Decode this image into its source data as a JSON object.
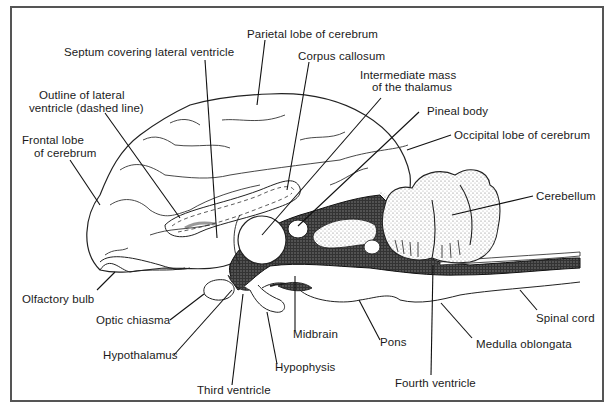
{
  "diagram": {
    "type": "anatomical-illustration",
    "border_color": "#555555",
    "ink_color": "#1a1a1a",
    "labels": [
      {
        "id": "parietal",
        "text": "Parietal lobe of cerebrum"
      },
      {
        "id": "septum",
        "text": "Septum covering lateral ventricle"
      },
      {
        "id": "corpus",
        "text": "Corpus callosum"
      },
      {
        "id": "outline1",
        "text": "Outline of lateral"
      },
      {
        "id": "outline2",
        "text": "ventricle (dashed line)"
      },
      {
        "id": "intermediate1",
        "text": "Intermediate mass"
      },
      {
        "id": "intermediate2",
        "text": "of the thalamus"
      },
      {
        "id": "pineal",
        "text": "Pineal body"
      },
      {
        "id": "occipital",
        "text": "Occipital lobe of cerebrum"
      },
      {
        "id": "frontal1",
        "text": "Frontal lobe"
      },
      {
        "id": "frontal2",
        "text": "of cerebrum"
      },
      {
        "id": "cerebellum",
        "text": "Cerebellum"
      },
      {
        "id": "olfactory",
        "text": "Olfactory bulb"
      },
      {
        "id": "optic",
        "text": "Optic chiasma"
      },
      {
        "id": "midbrain",
        "text": "Midbrain"
      },
      {
        "id": "spinal",
        "text": "Spinal cord"
      },
      {
        "id": "hypothalamus",
        "text": "Hypothalamus"
      },
      {
        "id": "pons",
        "text": "Pons"
      },
      {
        "id": "medulla",
        "text": "Medulla oblongata"
      },
      {
        "id": "hypophysis",
        "text": "Hypophysis"
      },
      {
        "id": "third",
        "text": "Third ventricle"
      },
      {
        "id": "fourth",
        "text": "Fourth ventricle"
      }
    ]
  }
}
